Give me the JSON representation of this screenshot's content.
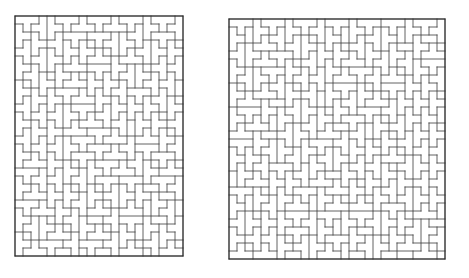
{
  "page": {
    "background_color": "#ffffff",
    "width": 469,
    "height": 278,
    "caption": ""
  },
  "style": {
    "line_color": "#3a3a3a",
    "border_color": "#2b2b2b",
    "line_width": 0.8,
    "border_width": 1.0,
    "tile_fill": "#ffffff"
  },
  "figures": [
    {
      "id": "figure-left",
      "name": "left-tiling",
      "label": "",
      "origin_x": 14,
      "origin_y": 15,
      "cell": 8,
      "cols": 21,
      "rows": 30,
      "width": 168,
      "height": 240,
      "tile_shape": "T-tetromino",
      "tile_count": 157,
      "seed": 20317
    },
    {
      "id": "figure-right",
      "name": "right-tiling",
      "label": "",
      "origin_x": 228,
      "origin_y": 18,
      "cell": 8,
      "cols": 27,
      "rows": 30,
      "width": 216,
      "height": 240,
      "tile_shape": "T-tetromino",
      "tile_count": 202,
      "seed": 77431
    }
  ]
}
